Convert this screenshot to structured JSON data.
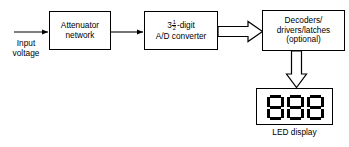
{
  "diagram": {
    "stroke_color": "#000000",
    "background_color": "#ffffff",
    "blocks": [
      {
        "id": "attenuator",
        "name": "attenuator-network-block",
        "line1": "Attenuator",
        "line2": "network"
      },
      {
        "id": "adc",
        "name": "ad-converter-block",
        "whole": "3",
        "numerator": "1",
        "denominator": "2",
        "suffix": "-digit",
        "line2": "A/D converter"
      },
      {
        "id": "decoders",
        "name": "decoders-drivers-latches-block",
        "line1": "Decoders/",
        "line2": "drivers/latches",
        "line3": "(optional)"
      }
    ],
    "labels": {
      "input_line1": "Input",
      "input_line2": "voltage",
      "led_display": "LED display"
    },
    "display": {
      "name": "led-display",
      "digit_count": 3,
      "segments_lit": [
        "a",
        "b",
        "c",
        "d",
        "e",
        "f",
        "g"
      ]
    },
    "connectors": [
      {
        "name": "input-arrow",
        "style": "thin-line-arrow",
        "direction": "right"
      },
      {
        "name": "attenuator-to-adc-arrow",
        "style": "thin-line-arrow",
        "direction": "right"
      },
      {
        "name": "adc-to-decoders-arrow",
        "style": "block-arrow",
        "direction": "right"
      },
      {
        "name": "decoders-to-display-arrow",
        "style": "block-arrow",
        "direction": "down"
      }
    ]
  }
}
